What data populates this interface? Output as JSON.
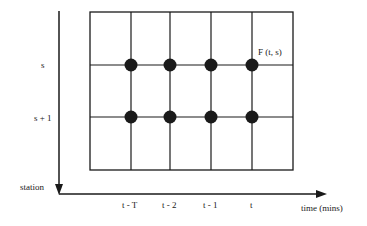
{
  "diagram": {
    "y_axis_label": "station",
    "x_axis_label": "time (mins)",
    "row_labels": [
      "s",
      "s + 1"
    ],
    "column_labels": [
      "t - T",
      "t - 2",
      "t - 1",
      "t"
    ],
    "point_label": "F (t, s)",
    "colors": {
      "ink": "#1a1a1a",
      "background": "#ffffff"
    }
  }
}
